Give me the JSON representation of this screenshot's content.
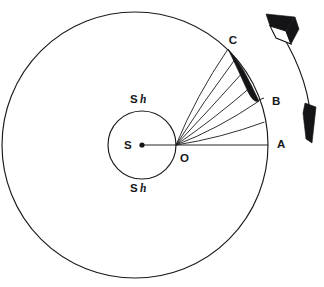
{
  "figure": {
    "background_color": "#ffffff",
    "ink_color": "#1a1a1d"
  },
  "labels": {
    "point_a": "A",
    "point_b": "B",
    "point_c": "C",
    "center_s": "S",
    "origin_o": "O",
    "shell_top_s": "S",
    "shell_top_h": "h",
    "shell_bottom_s": "S",
    "shell_bottom_h": "h"
  },
  "geometry": {
    "outer_circle": {
      "cx": 135,
      "cy": 145,
      "r": 133
    },
    "inner_circle": {
      "cx": 142,
      "cy": 145,
      "r": 34
    },
    "origin_point": {
      "x": 176,
      "y": 145
    },
    "center_point": {
      "x": 142,
      "y": 145
    },
    "point_a": {
      "x": 268,
      "y": 145
    },
    "point_b": {
      "x": 259,
      "y": 100
    },
    "point_c": {
      "x": 228,
      "y": 48
    },
    "ray_count": 6,
    "shaded_lens": "black crescent between chord OC and arc toward B"
  },
  "arrow": {
    "name": "rotation-direction-arrow",
    "style": "double-headed curved arrow",
    "head_top": "hollow 3d block arrowhead",
    "head_bottom": "solid slim arrowhead",
    "direction": "clockwise"
  }
}
